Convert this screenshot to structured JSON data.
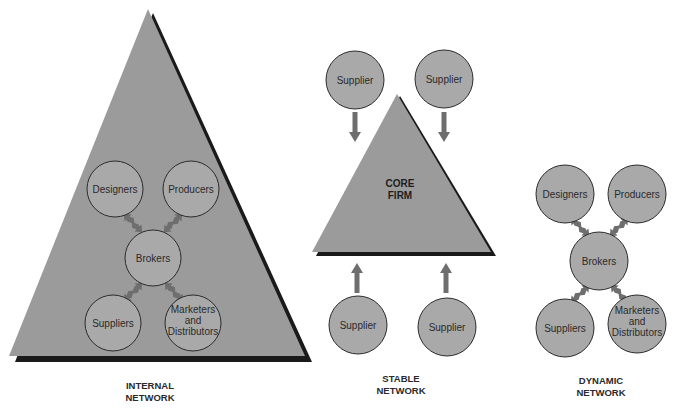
{
  "colors": {
    "triangle_fill": "#9b9b9b",
    "triangle_shadow": "#1a1a1a",
    "circle_fill": "#a9a9a9",
    "circle_stroke": "#2b2b2b",
    "arrow": "#6e6e6e"
  },
  "internal_network": {
    "title_line1": "INTERNAL",
    "title_line2": "NETWORK",
    "nodes": {
      "designers": "Designers",
      "producers": "Producers",
      "brokers": "Brokers",
      "suppliers": "Suppliers",
      "marketers_line1": "Marketers",
      "marketers_line2": "and",
      "marketers_line3": "Distributors"
    }
  },
  "stable_network": {
    "title_line1": "STABLE",
    "title_line2": "NETWORK",
    "core_line1": "CORE",
    "core_line2": "FIRM",
    "suppliers": [
      "Supplier",
      "Supplier",
      "Supplier",
      "Supplier"
    ]
  },
  "dynamic_network": {
    "title_line1": "DYNAMIC",
    "title_line2": "NETWORK",
    "nodes": {
      "designers": "Designers",
      "producers": "Producers",
      "brokers": "Brokers",
      "suppliers": "Suppliers",
      "marketers_line1": "Marketers",
      "marketers_line2": "and",
      "marketers_line3": "Distributors"
    }
  }
}
